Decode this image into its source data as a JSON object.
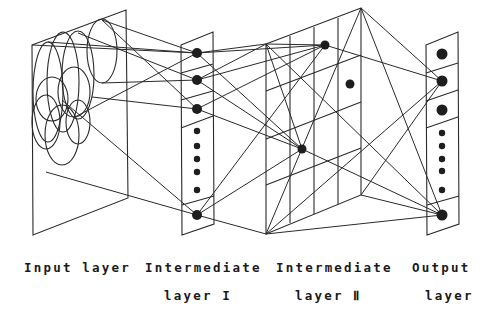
{
  "figure": {
    "type": "neural-network-layers-diagram",
    "line_color": "#2a2a2a",
    "node_color": "#1e1e1e",
    "background": "#ffffff"
  },
  "labels": {
    "input": {
      "line1": "Input layer",
      "line2": ""
    },
    "intermediate1": {
      "line1": "Intermediate",
      "line2": "layer  I"
    },
    "intermediate2": {
      "line1": "Intermediate",
      "line2": "layer  Ⅱ"
    },
    "output": {
      "line1": "Output",
      "line2": "layer"
    }
  },
  "layers": {
    "input": {
      "plane": [
        [
          32,
          45
        ],
        [
          126,
          10
        ],
        [
          128,
          198
        ],
        [
          33,
          235
        ]
      ],
      "receptive_fields": [
        {
          "cx": 48,
          "cy": 92,
          "rx": 15,
          "ry": 50
        },
        {
          "cx": 63,
          "cy": 82,
          "rx": 16,
          "ry": 50
        },
        {
          "cx": 78,
          "cy": 75,
          "rx": 16,
          "ry": 44
        },
        {
          "cx": 102,
          "cy": 51,
          "rx": 15,
          "ry": 32
        },
        {
          "cx": 52,
          "cy": 99,
          "rx": 16,
          "ry": 22
        },
        {
          "cx": 74,
          "cy": 92,
          "rx": 16,
          "ry": 25
        },
        {
          "cx": 46,
          "cy": 122,
          "rx": 14,
          "ry": 27
        },
        {
          "cx": 62,
          "cy": 135,
          "rx": 17,
          "ry": 30
        },
        {
          "cx": 78,
          "cy": 122,
          "rx": 12,
          "ry": 22
        }
      ]
    },
    "intermediate1": {
      "panel": [
        [
          181,
          45
        ],
        [
          213,
          32
        ],
        [
          214,
          224
        ],
        [
          182,
          235
        ]
      ],
      "dividers": [
        [
          [
            181,
            73
          ],
          [
            213,
            64
          ]
        ],
        [
          [
            181,
            100
          ],
          [
            213,
            91
          ]
        ],
        [
          [
            181,
            128
          ],
          [
            213,
            116
          ]
        ],
        [
          [
            182,
            205
          ],
          [
            214,
            196
          ]
        ]
      ],
      "nodes": [
        {
          "x": 197,
          "y": 53,
          "r": 5
        },
        {
          "x": 197,
          "y": 80,
          "r": 5
        },
        {
          "x": 197,
          "y": 109,
          "r": 5
        },
        {
          "x": 197,
          "y": 131,
          "r": 3.2
        },
        {
          "x": 197,
          "y": 146,
          "r": 3.2
        },
        {
          "x": 197,
          "y": 159,
          "r": 3.2
        },
        {
          "x": 197,
          "y": 172,
          "r": 3.2
        },
        {
          "x": 197,
          "y": 190,
          "r": 3.2
        },
        {
          "x": 197,
          "y": 215,
          "r": 5
        }
      ]
    },
    "intermediate2": {
      "box_outline": [
        [
          266,
          44
        ],
        [
          361,
          8
        ],
        [
          361,
          195
        ],
        [
          266,
          234
        ]
      ],
      "grid_vertical": [
        [
          [
            290,
            36
          ],
          [
            290,
            223
          ]
        ],
        [
          [
            314,
            27
          ],
          [
            314,
            214
          ]
        ],
        [
          [
            338,
            18
          ],
          [
            338,
            204
          ]
        ]
      ],
      "grid_horizontal": [
        [
          [
            266,
            91
          ],
          [
            361,
            55
          ]
        ],
        [
          [
            266,
            139
          ],
          [
            361,
            102
          ]
        ],
        [
          [
            266,
            185
          ],
          [
            361,
            148
          ]
        ]
      ],
      "nodes": [
        {
          "x": 325,
          "y": 45,
          "r": 4.5
        },
        {
          "x": 350,
          "y": 84,
          "r": 4.5
        },
        {
          "x": 302,
          "y": 149,
          "r": 4.5
        }
      ]
    },
    "output": {
      "panel": [
        [
          426,
          45
        ],
        [
          458,
          32
        ],
        [
          459,
          224
        ],
        [
          427,
          235
        ]
      ],
      "dividers": [
        [
          [
            426,
            73
          ],
          [
            458,
            63
          ]
        ],
        [
          [
            426,
            101
          ],
          [
            458,
            90
          ]
        ],
        [
          [
            426,
            128
          ],
          [
            458,
            117
          ]
        ],
        [
          [
            427,
            205
          ],
          [
            459,
            196
          ]
        ]
      ],
      "nodes": [
        {
          "x": 442,
          "y": 54,
          "r": 5.5
        },
        {
          "x": 442,
          "y": 81,
          "r": 5.5
        },
        {
          "x": 442,
          "y": 110,
          "r": 5.5
        },
        {
          "x": 442,
          "y": 133,
          "r": 3.2
        },
        {
          "x": 442,
          "y": 146,
          "r": 3.2
        },
        {
          "x": 442,
          "y": 159,
          "r": 3.2
        },
        {
          "x": 442,
          "y": 171,
          "r": 3.2
        },
        {
          "x": 442,
          "y": 190,
          "r": 3.2
        },
        {
          "x": 442,
          "y": 215,
          "r": 5.5
        }
      ]
    }
  },
  "connections": [
    [
      [
        48,
        42
      ],
      [
        197,
        53
      ]
    ],
    [
      [
        102,
        20
      ],
      [
        197,
        53
      ]
    ],
    [
      [
        32,
        45
      ],
      [
        197,
        53
      ]
    ],
    [
      [
        102,
        20
      ],
      [
        197,
        109
      ]
    ],
    [
      [
        78,
        33
      ],
      [
        197,
        80
      ]
    ],
    [
      [
        102,
        83
      ],
      [
        197,
        80
      ]
    ],
    [
      [
        75,
        117
      ],
      [
        197,
        53
      ]
    ],
    [
      [
        92,
        97
      ],
      [
        197,
        109
      ]
    ],
    [
      [
        62,
        100
      ],
      [
        197,
        215
      ]
    ],
    [
      [
        46,
        172
      ],
      [
        197,
        215
      ]
    ],
    [
      [
        197,
        53
      ],
      [
        266,
        44
      ]
    ],
    [
      [
        197,
        53
      ],
      [
        325,
        45
      ]
    ],
    [
      [
        197,
        53
      ],
      [
        302,
        149
      ]
    ],
    [
      [
        197,
        80
      ],
      [
        325,
        45
      ]
    ],
    [
      [
        197,
        80
      ],
      [
        302,
        149
      ]
    ],
    [
      [
        197,
        109
      ],
      [
        325,
        45
      ]
    ],
    [
      [
        197,
        109
      ],
      [
        302,
        149
      ]
    ],
    [
      [
        197,
        215
      ],
      [
        325,
        45
      ]
    ],
    [
      [
        197,
        215
      ],
      [
        302,
        149
      ]
    ],
    [
      [
        197,
        215
      ],
      [
        266,
        234
      ]
    ],
    [
      [
        197,
        80
      ],
      [
        266,
        44
      ]
    ],
    [
      [
        266,
        44
      ],
      [
        325,
        45
      ]
    ],
    [
      [
        266,
        44
      ],
      [
        302,
        149
      ]
    ],
    [
      [
        266,
        44
      ],
      [
        442,
        215
      ]
    ],
    [
      [
        325,
        45
      ],
      [
        442,
        81
      ]
    ],
    [
      [
        361,
        8
      ],
      [
        442,
        81
      ]
    ],
    [
      [
        361,
        8
      ],
      [
        442,
        215
      ]
    ],
    [
      [
        361,
        8
      ],
      [
        266,
        234
      ]
    ],
    [
      [
        266,
        234
      ],
      [
        442,
        81
      ]
    ],
    [
      [
        266,
        234
      ],
      [
        442,
        215
      ]
    ],
    [
      [
        361,
        195
      ],
      [
        442,
        81
      ]
    ],
    [
      [
        361,
        195
      ],
      [
        442,
        215
      ]
    ],
    [
      [
        302,
        149
      ],
      [
        442,
        215
      ]
    ]
  ]
}
